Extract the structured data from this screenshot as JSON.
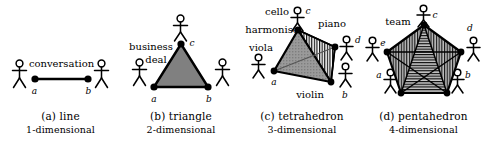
{
  "figure": {
    "panel_count": 4
  },
  "panels": [
    {
      "id": "panel-line",
      "caption_label": "(a) line",
      "caption_dimension": "1-dimensional",
      "shape": "line",
      "relation_label": "conversation",
      "people": 2,
      "vertices": [
        {
          "name": "a",
          "label": "a"
        },
        {
          "name": "b",
          "label": "b"
        }
      ],
      "edge_labels": [],
      "fill": "none"
    },
    {
      "id": "panel-triangle",
      "caption_label": "(b) triangle",
      "caption_dimension": "2-dimensional",
      "shape": "triangle",
      "relation_label_line1": "business",
      "relation_label_line2": "deal",
      "people": 3,
      "vertices": [
        {
          "name": "a",
          "label": "a"
        },
        {
          "name": "b",
          "label": "b"
        },
        {
          "name": "c",
          "label": "c"
        }
      ],
      "fill": "#808080"
    },
    {
      "id": "panel-tetrahedron",
      "caption_label": "(c) tetrahedron",
      "caption_dimension": "3-dimensional",
      "shape": "tetrahedron",
      "relation_label": "harmonise",
      "people": 4,
      "vertices": [
        {
          "name": "a",
          "label": "a",
          "role": "viola"
        },
        {
          "name": "b",
          "label": "b",
          "role": "violin"
        },
        {
          "name": "c",
          "label": "c",
          "role": "cello"
        },
        {
          "name": "d",
          "label": "d",
          "role": "piano"
        }
      ],
      "fill": "#9a9a9a",
      "hatch": "vertical"
    },
    {
      "id": "panel-pentahedron",
      "caption_label": "(d) pentahedron",
      "caption_dimension": "4-dimensional",
      "shape": "pentahedron",
      "relation_label": "team",
      "people": 5,
      "vertices": [
        {
          "name": "a",
          "label": "a"
        },
        {
          "name": "b",
          "label": "b"
        },
        {
          "name": "c",
          "label": "c"
        },
        {
          "name": "d",
          "label": "d"
        },
        {
          "name": "e",
          "label": "e"
        }
      ],
      "fill": "#a8a8a8",
      "hatch": "horizontal"
    }
  ],
  "colors": {
    "ink": "#000000",
    "background": "#ffffff",
    "fill_light": "#a8a8a8",
    "fill_mid": "#909090",
    "fill_dark": "#787878"
  }
}
